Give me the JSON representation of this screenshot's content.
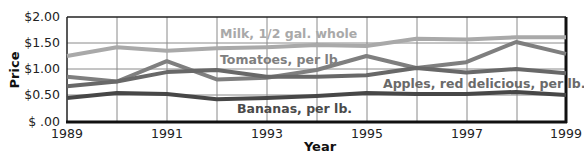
{
  "chart_data": {
    "type": "line",
    "title": "",
    "xlabel": "Year",
    "ylabel": "Price",
    "x": [
      1989,
      1990,
      1991,
      1992,
      1993,
      1994,
      1995,
      1996,
      1997,
      1998,
      1999
    ],
    "x_tick_labels": [
      "1989",
      "1991",
      "1993",
      "1995",
      "1997",
      "1999"
    ],
    "y_tick_labels": [
      "$2.00",
      "$1.50",
      "$1.00",
      "$0.50",
      "$ .00"
    ],
    "ylim": [
      0,
      2.0
    ],
    "xlim": [
      1989,
      1999
    ],
    "grid": true,
    "legend_position": "inline labels",
    "series": [
      {
        "name": "Milk, 1/2 gal. whole",
        "color": "#a9a9a9",
        "values": [
          1.25,
          1.42,
          1.35,
          1.4,
          1.42,
          1.46,
          1.44,
          1.58,
          1.57,
          1.61,
          1.61
        ]
      },
      {
        "name": "Tomatoes, per lb.",
        "color": "#7f7f7f",
        "values": [
          0.85,
          0.76,
          1.15,
          0.8,
          0.83,
          0.98,
          1.25,
          1.02,
          1.13,
          1.52,
          1.29
        ]
      },
      {
        "name": "Apples, red delicious, per lb.",
        "color": "#686868",
        "values": [
          0.67,
          0.76,
          0.94,
          0.98,
          0.85,
          0.85,
          0.88,
          1.02,
          0.93,
          1.0,
          0.92
        ]
      },
      {
        "name": "Bananas, per lb.",
        "color": "#474747",
        "values": [
          0.44,
          0.54,
          0.52,
          0.42,
          0.44,
          0.48,
          0.54,
          0.52,
          0.52,
          0.56,
          0.5
        ]
      }
    ]
  },
  "labels": {
    "milk": "Milk, 1/2 gal. whole",
    "tomatoes": "Tomatoes, per lb.",
    "apples": "Apples, red delicious, per lb.",
    "bananas": "Bananas, per lb.",
    "xlabel": "Year",
    "ylabel": "Price",
    "y0": "$2.00",
    "y1": "$1.50",
    "y2": "$1.00",
    "y3": "$0.50",
    "y4": "$ .00",
    "x0": "1989",
    "x1": "1991",
    "x2": "1993",
    "x3": "1995",
    "x4": "1997",
    "x5": "1999"
  }
}
